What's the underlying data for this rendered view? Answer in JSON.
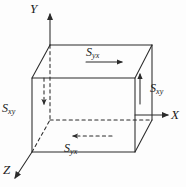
{
  "figure": {
    "type": "3d-cuboid-stress-diagram",
    "background_color": "#fdfdfd",
    "line_color": "#2b2b2b"
  },
  "axes": [
    {
      "name": "y-axis",
      "label": "Y",
      "direction": "up",
      "label_x": 30,
      "label_y": 2
    },
    {
      "name": "x-axis",
      "label": "X",
      "direction": "right",
      "label_x": 171,
      "label_y": 108
    },
    {
      "name": "z-axis",
      "label": "Z",
      "direction": "down-left",
      "label_x": 3,
      "label_y": 163
    }
  ],
  "stress_labels": [
    {
      "name": "stress-top",
      "symbol": "S",
      "subscript": "yx",
      "arrow": "right",
      "x": 86,
      "y": 46
    },
    {
      "name": "stress-right",
      "symbol": "S",
      "subscript": "xy",
      "arrow": "up",
      "x": 150,
      "y": 82
    },
    {
      "name": "stress-left",
      "symbol": "S",
      "subscript": "xy",
      "arrow": "down",
      "x": 2,
      "y": 102
    },
    {
      "name": "stress-bottom",
      "symbol": "S",
      "subscript": "yx",
      "arrow": "left",
      "x": 64,
      "y": 142
    }
  ],
  "geometry": {
    "front_face": {
      "left": 32,
      "top": 78,
      "right": 135,
      "bottom": 152
    },
    "back_face": {
      "left": 50,
      "top": 45,
      "right": 152,
      "bottom": 120
    },
    "hidden_edges": "dashed"
  }
}
